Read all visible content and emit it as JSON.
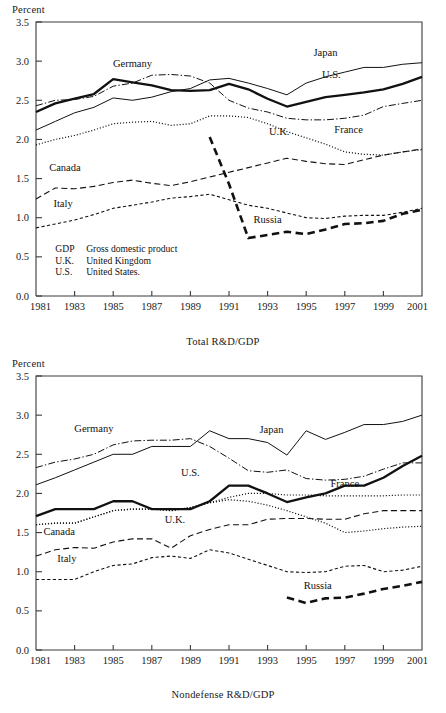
{
  "page": {
    "y_axis_unit": "Percent"
  },
  "legend_notes": [
    {
      "abbr": "GDP",
      "meaning": "Gross domestic product"
    },
    {
      "abbr": "U.K.",
      "meaning": "United Kingdom"
    },
    {
      "abbr": "U.S.",
      "meaning": "United States."
    }
  ],
  "chart_data": [
    {
      "type": "line",
      "id": "total-rd-gdp",
      "title": "Total R&D/GDP",
      "xlabel": "Total R&D/GDP",
      "ylabel": "Percent",
      "xlim": [
        1981,
        2001
      ],
      "ylim": [
        0.0,
        3.5
      ],
      "yticks": [
        "0.0",
        "0.5",
        "1.0",
        "1.5",
        "2.0",
        "2.5",
        "3.0",
        "3.5"
      ],
      "xticks": [
        "1981",
        "1983",
        "1985",
        "1987",
        "1989",
        "1991",
        "1993",
        "1995",
        "1997",
        "1999",
        "2001"
      ],
      "grid": false,
      "legend_position": "inline-annotations",
      "x": [
        1981,
        1982,
        1983,
        1984,
        1985,
        1986,
        1987,
        1988,
        1989,
        1990,
        1991,
        1992,
        1993,
        1994,
        1995,
        1996,
        1997,
        1998,
        1999,
        2000,
        2001
      ],
      "series": [
        {
          "name": "U.S.",
          "style": "solid-thick",
          "label_x": 1996.3,
          "label_y": 2.78,
          "values": [
            2.35,
            2.46,
            2.52,
            2.58,
            2.77,
            2.73,
            2.69,
            2.63,
            2.62,
            2.63,
            2.71,
            2.64,
            2.52,
            2.42,
            2.48,
            2.54,
            2.57,
            2.6,
            2.64,
            2.71,
            2.8
          ]
        },
        {
          "name": "Japan",
          "style": "solid-thin",
          "label_x": 1996.0,
          "label_y": 3.06,
          "values": [
            2.12,
            2.23,
            2.34,
            2.41,
            2.53,
            2.5,
            2.54,
            2.61,
            2.65,
            2.76,
            2.78,
            2.72,
            2.65,
            2.57,
            2.72,
            2.8,
            2.86,
            2.92,
            2.92,
            2.96,
            2.98
          ]
        },
        {
          "name": "Germany",
          "style": "dash-dot",
          "label_x": 1986.0,
          "label_y": 2.93,
          "values": [
            2.43,
            2.5,
            2.51,
            2.55,
            2.68,
            2.72,
            2.82,
            2.83,
            2.81,
            2.72,
            2.5,
            2.4,
            2.35,
            2.27,
            2.25,
            2.25,
            2.27,
            2.31,
            2.42,
            2.46,
            2.5
          ]
        },
        {
          "name": "France",
          "style": "dash-dot",
          "label_x": 1997.2,
          "label_y": 2.08,
          "values": [
            null,
            null,
            null,
            null,
            null,
            null,
            null,
            null,
            null,
            null,
            null,
            null,
            null,
            null,
            null,
            null,
            null,
            null,
            null,
            null,
            null
          ]
        },
        {
          "name": "U.K.",
          "style": "dotted",
          "label_x": 1993.6,
          "label_y": 2.06,
          "values": [
            1.93,
            2.0,
            2.05,
            2.12,
            2.2,
            2.22,
            2.23,
            2.18,
            2.2,
            2.3,
            2.3,
            2.28,
            2.2,
            2.1,
            2.02,
            1.94,
            1.84,
            1.81,
            1.8,
            1.84,
            1.87
          ]
        },
        {
          "name": "Canada",
          "style": "dashed-medium",
          "label_x": 1982.5,
          "label_y": 1.6,
          "values": [
            1.24,
            1.38,
            1.37,
            1.4,
            1.45,
            1.48,
            1.44,
            1.41,
            1.46,
            1.52,
            1.58,
            1.64,
            1.7,
            1.76,
            1.72,
            1.69,
            1.68,
            1.74,
            1.8,
            1.84,
            1.88
          ]
        },
        {
          "name": "Italy",
          "style": "dashed-short",
          "label_x": 1982.4,
          "label_y": 1.14,
          "values": [
            0.87,
            0.92,
            0.97,
            1.04,
            1.12,
            1.16,
            1.2,
            1.25,
            1.27,
            1.3,
            1.23,
            1.16,
            1.12,
            1.06,
            1.0,
            0.99,
            1.02,
            1.03,
            1.03,
            1.07,
            1.12
          ]
        },
        {
          "name": "Russia",
          "style": "dashed-thick",
          "label_x": 1993.0,
          "label_y": 0.93,
          "values": [
            null,
            null,
            null,
            null,
            null,
            null,
            null,
            null,
            null,
            2.03,
            1.43,
            0.74,
            0.78,
            0.82,
            0.79,
            0.85,
            0.92,
            0.93,
            0.96,
            1.05,
            1.1
          ]
        }
      ]
    },
    {
      "type": "line",
      "id": "nondefense-rd-gdp",
      "title": "Nondefense R&D/GDP",
      "xlabel": "Nondefense R&D/GDP",
      "ylabel": "Percent",
      "xlim": [
        1981,
        2001
      ],
      "ylim": [
        0.0,
        3.5
      ],
      "yticks": [
        "0.0",
        "0.5",
        "1.0",
        "1.5",
        "2.0",
        "2.5",
        "3.0",
        "3.5"
      ],
      "xticks": [
        "1981",
        "1983",
        "1985",
        "1987",
        "1989",
        "1991",
        "1993",
        "1995",
        "1997",
        "1999",
        "2001"
      ],
      "grid": false,
      "legend_position": "inline-annotations",
      "x": [
        1981,
        1982,
        1983,
        1984,
        1985,
        1986,
        1987,
        1988,
        1989,
        1990,
        1991,
        1992,
        1993,
        1994,
        1995,
        1996,
        1997,
        1998,
        1999,
        2000,
        2001
      ],
      "series": [
        {
          "name": "U.S.",
          "style": "solid-thick",
          "label_x": 1989.0,
          "label_y": 2.22,
          "values": [
            1.71,
            1.8,
            1.8,
            1.8,
            1.9,
            1.9,
            1.8,
            1.8,
            1.8,
            1.9,
            2.1,
            2.1,
            2.0,
            1.89,
            1.95,
            2.0,
            2.1,
            2.1,
            2.2,
            2.35,
            2.48
          ]
        },
        {
          "name": "Japan",
          "style": "solid-thin",
          "label_x": 1993.2,
          "label_y": 2.77,
          "values": [
            2.11,
            2.2,
            2.3,
            2.4,
            2.5,
            2.5,
            2.6,
            2.6,
            2.6,
            2.8,
            2.7,
            2.7,
            2.65,
            2.49,
            2.8,
            2.69,
            2.78,
            2.88,
            2.88,
            2.92,
            3.0
          ]
        },
        {
          "name": "Germany",
          "style": "dash-dot",
          "label_x": 1984.0,
          "label_y": 2.78,
          "values": [
            2.33,
            2.4,
            2.44,
            2.5,
            2.62,
            2.67,
            2.68,
            2.68,
            2.7,
            2.6,
            2.45,
            2.29,
            2.27,
            2.3,
            2.19,
            2.17,
            2.18,
            2.22,
            2.31,
            2.39,
            2.39
          ]
        },
        {
          "name": "France",
          "style": "dotted",
          "label_x": 1997.0,
          "label_y": 2.08,
          "values": [
            1.6,
            1.62,
            1.62,
            1.7,
            1.78,
            1.8,
            1.8,
            1.78,
            1.82,
            1.88,
            1.95,
            2.0,
            2.0,
            1.98,
            1.98,
            1.97,
            1.97,
            1.97,
            1.97,
            1.98,
            1.98
          ]
        },
        {
          "name": "U.K.",
          "style": "dotted",
          "label_x": 1988.2,
          "label_y": 1.62,
          "values": [
            1.6,
            1.62,
            1.62,
            1.7,
            1.78,
            1.8,
            1.8,
            1.78,
            1.82,
            1.88,
            1.92,
            1.9,
            1.85,
            1.78,
            1.7,
            1.62,
            1.5,
            1.52,
            1.55,
            1.57,
            1.58
          ]
        },
        {
          "name": "Canada",
          "style": "dashed-medium",
          "label_x": 1982.2,
          "label_y": 1.47,
          "values": [
            1.2,
            1.28,
            1.31,
            1.3,
            1.38,
            1.42,
            1.42,
            1.3,
            1.46,
            1.54,
            1.6,
            1.6,
            1.67,
            1.68,
            1.68,
            1.67,
            1.67,
            1.74,
            1.78,
            1.78,
            1.78
          ]
        },
        {
          "name": "Italy",
          "style": "dashed-short",
          "label_x": 1982.6,
          "label_y": 1.12,
          "values": [
            0.9,
            0.9,
            0.9,
            1.0,
            1.08,
            1.1,
            1.18,
            1.2,
            1.17,
            1.28,
            1.24,
            1.16,
            1.08,
            1.0,
            0.99,
            1.0,
            1.07,
            1.08,
            1.0,
            1.02,
            1.07
          ]
        },
        {
          "name": "Russia",
          "style": "dashed-thick",
          "label_x": 1995.6,
          "label_y": 0.78,
          "values": [
            null,
            null,
            null,
            null,
            null,
            null,
            null,
            null,
            null,
            null,
            null,
            null,
            null,
            0.67,
            0.6,
            0.66,
            0.67,
            0.72,
            0.78,
            0.82,
            0.87
          ]
        }
      ]
    }
  ]
}
